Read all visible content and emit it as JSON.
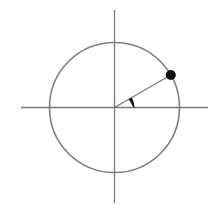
{
  "diagram": {
    "type": "unit-circle",
    "canvas": {
      "width": 214,
      "height": 208,
      "background": "#ffffff"
    },
    "colors": {
      "axis": "#7a7a7a",
      "circle": "#7f7f7f",
      "radius": "#7a7a7a",
      "point": "#111111",
      "angle_marker": "#111111"
    },
    "center": {
      "x": 114.5,
      "y": 107.5
    },
    "circle": {
      "radius": 65,
      "stroke_width": 1.6
    },
    "x_axis": {
      "x1": 21,
      "x2": 208,
      "y": 107.5,
      "stroke_width": 1.3
    },
    "y_axis": {
      "x": 114.5,
      "y1": 10,
      "y2": 203,
      "stroke_width": 1.3
    },
    "radius_segment": {
      "angle_deg": 30,
      "stroke_width": 1.4
    },
    "point": {
      "angle_deg": 30,
      "r": 5
    },
    "angle_marker": {
      "angle_deg": 30,
      "arc_radius": 20,
      "label": ""
    }
  }
}
